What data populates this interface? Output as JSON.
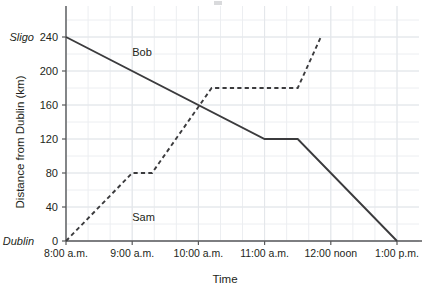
{
  "chart_data": {
    "type": "line",
    "title": "",
    "xlabel": "Time",
    "ylabel": "Distance from Dublin (km)",
    "xlim": [
      8,
      13
    ],
    "ylim": [
      0,
      260
    ],
    "grid": true,
    "legend_position": "inline-labels",
    "x_tick_labels": [
      "8:00 a.m.",
      "9:00 a.m.",
      "10:00 a.m.",
      "11:00 a.m.",
      "12:00 noon",
      "1:00 p.m."
    ],
    "x_tick_values": [
      8,
      9,
      10,
      11,
      12,
      13
    ],
    "y_tick_labels": [
      "0",
      "40",
      "80",
      "120",
      "160",
      "200",
      "240"
    ],
    "y_tick_values": [
      0,
      40,
      80,
      120,
      160,
      200,
      240
    ],
    "y_endpoint_labels": [
      {
        "name": "origin-label",
        "text": "Dublin",
        "value": 0
      },
      {
        "name": "destination-label",
        "text": "Sligo",
        "value": 240
      }
    ],
    "series": [
      {
        "name": "Bob",
        "label": "Bob",
        "style": "solid",
        "label_x": 9.0,
        "label_y": 222,
        "points": [
          {
            "x": 8.0,
            "y": 240
          },
          {
            "x": 11.0,
            "y": 120
          },
          {
            "x": 11.5,
            "y": 120
          },
          {
            "x": 13.0,
            "y": 0
          }
        ]
      },
      {
        "name": "Sam",
        "label": "Sam",
        "style": "dashed",
        "label_x": 9.0,
        "label_y": 28,
        "points": [
          {
            "x": 8.0,
            "y": 0
          },
          {
            "x": 9.0,
            "y": 80
          },
          {
            "x": 9.3,
            "y": 80
          },
          {
            "x": 10.2,
            "y": 180
          },
          {
            "x": 11.5,
            "y": 180
          },
          {
            "x": 11.85,
            "y": 240
          }
        ]
      }
    ],
    "annotations": [
      {
        "name": "crossing-point",
        "x": 10.0,
        "y": 160,
        "text": ""
      }
    ]
  }
}
